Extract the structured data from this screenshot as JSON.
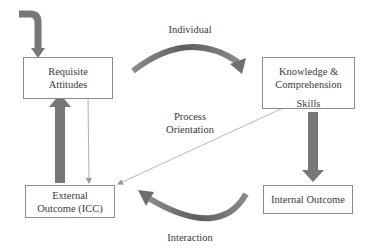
{
  "diagram": {
    "nodes": {
      "requisite_attitudes": {
        "line1": "Requisite",
        "line2": "Attitudes"
      },
      "knowledge_skills": {
        "line1": "Knowledge &",
        "line2": "Comprehension",
        "line3": "Skills"
      },
      "external_outcome": {
        "line1": "External",
        "line2": "Outcome (ICC)"
      },
      "internal_outcome": {
        "line1": "Internal Outcome"
      }
    },
    "edge_labels": {
      "individual": "Individual",
      "process_line1": "Process",
      "process_line2": "Orientation",
      "interaction": "Interaction"
    },
    "edges": [
      {
        "from": "entry",
        "to": "requisite_attitudes",
        "style": "thick"
      },
      {
        "from": "requisite_attitudes",
        "to": "knowledge_skills",
        "style": "thick-curved",
        "label": "Individual"
      },
      {
        "from": "knowledge_skills",
        "to": "internal_outcome",
        "style": "thick"
      },
      {
        "from": "internal_outcome",
        "to": "external_outcome",
        "style": "thick-curved",
        "label": "Interaction"
      },
      {
        "from": "external_outcome",
        "to": "requisite_attitudes",
        "style": "thick"
      },
      {
        "from": "requisite_attitudes",
        "to": "external_outcome",
        "style": "thin"
      },
      {
        "from": "knowledge_skills",
        "to": "external_outcome",
        "style": "thin",
        "label": "Process Orientation"
      }
    ],
    "colors": {
      "thick_arrow": "#777777",
      "thin_line": "#b0b0b0",
      "box_border": "#8a8a8a"
    }
  }
}
